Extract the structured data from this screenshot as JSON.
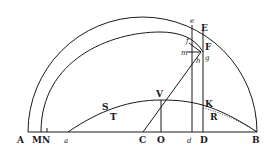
{
  "diagram": {
    "type": "geometric figure",
    "colors": {
      "ink": "#1a1a1a",
      "background": "#ffffff"
    },
    "labels": {
      "A": "A",
      "M": "M",
      "N": "N",
      "a": "a",
      "C": "C",
      "O": "O",
      "d": "d",
      "D": "D",
      "B": "B",
      "e": "e",
      "E": "E",
      "f": "f",
      "F": "F",
      "m": "m",
      "g": "g",
      "h": "h",
      "V": "V",
      "K": "K",
      "S": "S",
      "T": "T",
      "R": "R"
    }
  }
}
